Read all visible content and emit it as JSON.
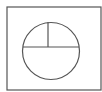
{
  "diagram": {
    "type": "geometry",
    "stroke_color": "#555555",
    "background_color": "#ffffff",
    "rectangle": {
      "x": 7,
      "y": 7,
      "width": 94,
      "height": 83
    },
    "circle": {
      "cx": 51,
      "cy": 51,
      "r": 28.5
    },
    "diameter": {
      "x1": 23,
      "y1": 47,
      "x2": 79,
      "y2": 47
    },
    "radius": {
      "x1": 48,
      "y1": 47,
      "x2": 48,
      "y2": 22
    }
  }
}
